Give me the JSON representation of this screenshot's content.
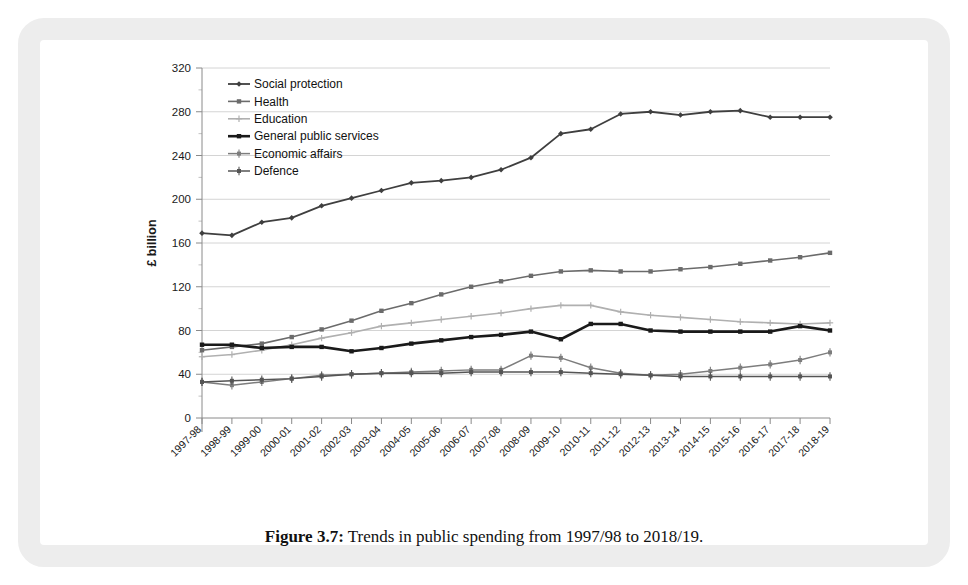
{
  "figure": {
    "caption_label": "Figure 3.7:",
    "caption_text": " Trends in public spending from 1997/98 to 2018/19."
  },
  "chart_data": {
    "type": "line",
    "title": "",
    "subtitle": "",
    "xlabel": "",
    "ylabel": "£ billion",
    "ylim": [
      0,
      320
    ],
    "ytick_step": 40,
    "yticks": [
      0,
      40,
      80,
      120,
      160,
      200,
      240,
      280,
      320
    ],
    "grid": true,
    "legend_position": "top-left-inside",
    "categories": [
      "1997-98",
      "1998-99",
      "1999-00",
      "2000-01",
      "2001-02",
      "2002-03",
      "2003-04",
      "2004-05",
      "2005-06",
      "2006-07",
      "2007-08",
      "2008-09",
      "2009-10",
      "2010-11",
      "2011-12",
      "2012-13",
      "2013-14",
      "2014-15",
      "2015-16",
      "2016-17",
      "2017-18",
      "2018-19"
    ],
    "series": [
      {
        "name": "Social protection",
        "color": "#3f3f3f",
        "width": 1.8,
        "marker": "diamond",
        "values": [
          169,
          167,
          179,
          183,
          194,
          201,
          208,
          215,
          217,
          220,
          227,
          238,
          260,
          264,
          278,
          280,
          277,
          280,
          281,
          275,
          275,
          275
        ]
      },
      {
        "name": "Health",
        "color": "#6b6b6b",
        "width": 1.6,
        "marker": "square",
        "values": [
          62,
          65,
          68,
          74,
          81,
          89,
          98,
          105,
          113,
          120,
          125,
          130,
          134,
          135,
          134,
          134,
          136,
          138,
          141,
          144,
          147,
          151
        ]
      },
      {
        "name": "Education",
        "color": "#b0b0b0",
        "width": 1.6,
        "marker": "plus",
        "values": [
          56,
          58,
          62,
          67,
          73,
          78,
          84,
          87,
          90,
          93,
          96,
          100,
          103,
          103,
          97,
          94,
          92,
          90,
          88,
          87,
          86,
          87
        ]
      },
      {
        "name": "General public services",
        "color": "#1a1a1a",
        "width": 2.6,
        "marker": "square",
        "values": [
          67,
          67,
          64,
          65,
          65,
          61,
          64,
          68,
          71,
          74,
          76,
          79,
          72,
          86,
          86,
          80,
          79,
          79,
          79,
          79,
          84,
          80
        ]
      },
      {
        "name": "Economic affairs",
        "color": "#7d7d7d",
        "width": 1.5,
        "marker": "cross-bar",
        "values": [
          33,
          30,
          33,
          36,
          39,
          40,
          41,
          42,
          43,
          44,
          44,
          57,
          55,
          46,
          41,
          39,
          40,
          43,
          46,
          49,
          53,
          60
        ]
      },
      {
        "name": "Defence",
        "color": "#555555",
        "width": 1.5,
        "marker": "cross-bar",
        "values": [
          33,
          34,
          35,
          36,
          38,
          40,
          41,
          41,
          41,
          42,
          42,
          42,
          42,
          41,
          40,
          39,
          38,
          38,
          38,
          38,
          38,
          38
        ]
      }
    ]
  }
}
